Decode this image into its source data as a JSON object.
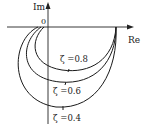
{
  "diagram": {
    "type": "nyquist-plot",
    "axes": {
      "y_label": "Im",
      "x_label": "Re",
      "origin_label": "0"
    },
    "curves": [
      {
        "id": "zeta-0.8",
        "label": "ζ =0.8",
        "zeta": 0.8
      },
      {
        "id": "zeta-0.6",
        "label": "ζ =0.6",
        "zeta": 0.6
      },
      {
        "id": "zeta-0.4",
        "label": "ζ =0.4",
        "zeta": 0.4
      }
    ],
    "colors": {
      "ink": "#1a1a1a",
      "background": "#ffffff"
    }
  }
}
